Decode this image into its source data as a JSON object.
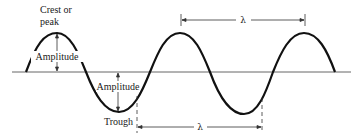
{
  "diagram": {
    "type": "wave-anatomy",
    "labels": {
      "crest_line1": "Crest or",
      "crest_line2": "peak",
      "amplitude_upper": "Amplitude",
      "amplitude_lower": "Amplitude",
      "trough": "Trough",
      "wavelength_top": "λ",
      "wavelength_bottom": "λ"
    },
    "colors": {
      "wave": "#111111",
      "baseline": "#666666",
      "annotation": "#333333"
    }
  }
}
